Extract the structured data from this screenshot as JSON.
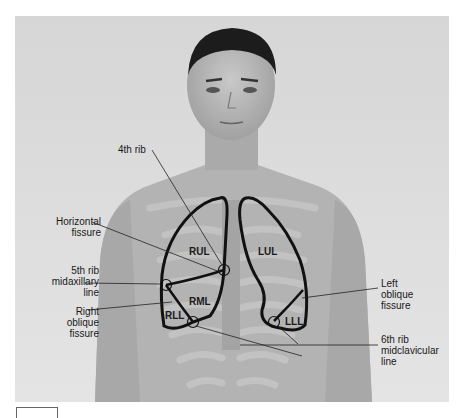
{
  "figure": {
    "colors": {
      "background": "#dcdcdc",
      "outline": "#111111",
      "skin": "#b8b8b8"
    }
  },
  "labels": {
    "rib4": "4th rib",
    "horizontal_fissure": [
      "Horizontal",
      "fissure"
    ],
    "rib5_midaxillary": [
      "5th rib",
      "midaxillary",
      "line"
    ],
    "right_oblique_fissure": [
      "Right",
      "oblique",
      "fissure"
    ],
    "left_oblique_fissure": [
      "Left",
      "oblique",
      "fissure"
    ],
    "rib6_midclavicular": [
      "6th rib",
      "midclavicular",
      "line"
    ]
  },
  "lobes": {
    "rul": "RUL",
    "rml": "RML",
    "rll": "RLL",
    "lul": "LUL",
    "lll": "LLL"
  }
}
